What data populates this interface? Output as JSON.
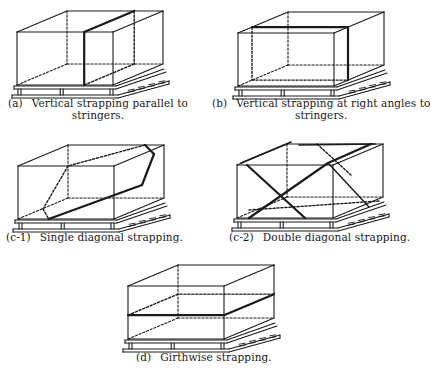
{
  "figure_title": "Methods of strapping palletized loads",
  "colors": {
    "ink": "#1a1a1a",
    "background": "#ffffff"
  },
  "figures": [
    {
      "id": "a",
      "tag": "(a)",
      "caption_line1": "Vertical strapping parallel to",
      "caption_line2": "stringers.",
      "strapping": "vertical-parallel",
      "origin": [
        17,
        32
      ],
      "caption_pos": [
        8,
        97
      ]
    },
    {
      "id": "b",
      "tag": "(b)",
      "caption_line1": "Vertical strapping at right angles to",
      "caption_line2": "stringers.",
      "strapping": "vertical-right-angle",
      "origin": [
        238,
        33
      ],
      "caption_pos": [
        212,
        97
      ]
    },
    {
      "id": "c-1",
      "tag": "(c-1)",
      "caption_line1": "Single diagonal strapping.",
      "caption_line2": "",
      "strapping": "single-diagonal",
      "origin": [
        18,
        166
      ],
      "caption_pos": [
        6,
        231
      ]
    },
    {
      "id": "c-2",
      "tag": "(c-2)",
      "caption_line1": "Double diagonal strapping.",
      "caption_line2": "",
      "strapping": "double-diagonal",
      "origin": [
        237,
        165
      ],
      "caption_pos": [
        229,
        231
      ]
    },
    {
      "id": "d",
      "tag": "(d)",
      "caption_line1": "Girthwise strapping.",
      "caption_line2": "",
      "strapping": "girthwise",
      "origin": [
        128,
        286
      ],
      "caption_pos": [
        136,
        351
      ]
    }
  ],
  "box_geometry": {
    "front_width": 96,
    "height": 53,
    "depth_dx": 50,
    "depth_dy": -21
  }
}
